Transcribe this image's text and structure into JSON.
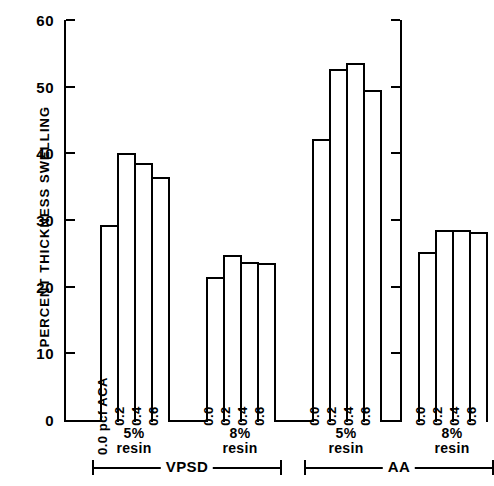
{
  "chart_data": {
    "type": "bar",
    "title": "",
    "xlabel": "",
    "ylabel": "PERCENT THICKNESS SWELLING",
    "ylim": [
      0,
      60
    ],
    "yticks": [
      0,
      10,
      20,
      30,
      40,
      50,
      60
    ],
    "ytick_labels": [
      "0",
      "10",
      "20",
      "30",
      "40",
      "50",
      "60"
    ],
    "grid": false,
    "legend": "none",
    "bar_style": "open outlined bars",
    "series_label": "pcf ACA",
    "categories": [
      "0.0",
      "0.2",
      "0.4",
      "0.6"
    ],
    "groups": [
      {
        "treatment": "VPSD",
        "resin": "5%",
        "resin_line1": "5%",
        "resin_line2": "resin",
        "bars": [
          {
            "label": "0.0",
            "first_label": "0.0  pcf ACA",
            "value": 29.5
          },
          {
            "label": "0.2",
            "first_label": "0.2",
            "value": 40.3
          },
          {
            "label": "0.4",
            "first_label": "0.4",
            "value": 38.8
          },
          {
            "label": "0.6",
            "first_label": "0.6",
            "value": 36.7
          }
        ]
      },
      {
        "treatment": "VPSD",
        "resin": "8%",
        "resin_line1": "8%",
        "resin_line2": "resin",
        "bars": [
          {
            "label": "0.0",
            "first_label": "0.0",
            "value": 21.7
          },
          {
            "label": "0.2",
            "first_label": "0.2",
            "value": 25.0
          },
          {
            "label": "0.4",
            "first_label": "0.4",
            "value": 24.0
          },
          {
            "label": "0.6",
            "first_label": "0.6",
            "value": 23.8
          }
        ]
      },
      {
        "treatment": "AA",
        "resin": "5%",
        "resin_line1": "5%",
        "resin_line2": "resin",
        "bars": [
          {
            "label": "0.0",
            "first_label": "0.0",
            "value": 42.5
          },
          {
            "label": "0.2",
            "first_label": "0.2",
            "value": 53.0
          },
          {
            "label": "0.4",
            "first_label": "0.4",
            "value": 53.8
          },
          {
            "label": "0.6",
            "first_label": "0.6",
            "value": 49.8
          }
        ]
      },
      {
        "treatment": "AA",
        "resin": "8%",
        "resin_line1": "8%",
        "resin_line2": "resin",
        "bars": [
          {
            "label": "0.0",
            "first_label": "0.0",
            "value": 25.5
          },
          {
            "label": "0.2",
            "first_label": "0.2",
            "value": 28.8
          },
          {
            "label": "0.4",
            "first_label": "0.4",
            "value": 28.8
          },
          {
            "label": "0.6",
            "first_label": "0.6",
            "value": 28.5
          }
        ]
      }
    ],
    "treatment_braces": [
      {
        "label": "VPSD"
      },
      {
        "label": "AA"
      }
    ],
    "colors": {
      "axis": "#000000",
      "bar_outline": "#000000",
      "bar_fill": "#ffffff",
      "background": "#ffffff"
    }
  }
}
